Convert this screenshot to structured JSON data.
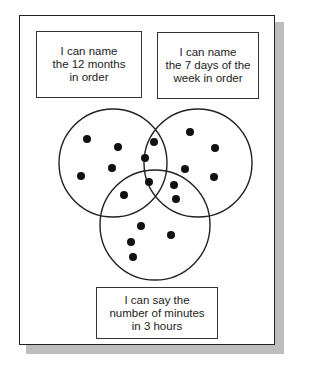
{
  "labels": {
    "months": "I can name\nthe 12 months\nin order",
    "days": "I can name\nthe 7 days of the\nweek in order",
    "minutes": "I can say the\nnumber of minutes\nin 3 hours"
  },
  "colors": {
    "stroke": "#222222",
    "dot": "#111111",
    "shadow": "#bdbdbd"
  },
  "venn": {
    "circles": [
      {
        "name": "months",
        "cx": 113,
        "cy": 163,
        "r": 54
      },
      {
        "name": "days",
        "cx": 198,
        "cy": 163,
        "r": 54
      },
      {
        "name": "minutes",
        "cx": 155,
        "cy": 225,
        "r": 55
      }
    ],
    "dots": [
      {
        "x": 87,
        "y": 139
      },
      {
        "x": 118,
        "y": 147
      },
      {
        "x": 112,
        "y": 168
      },
      {
        "x": 81,
        "y": 176
      },
      {
        "x": 154,
        "y": 142
      },
      {
        "x": 145,
        "y": 158
      },
      {
        "x": 149,
        "y": 182
      },
      {
        "x": 124,
        "y": 195
      },
      {
        "x": 190,
        "y": 132
      },
      {
        "x": 215,
        "y": 148
      },
      {
        "x": 185,
        "y": 169
      },
      {
        "x": 214,
        "y": 177
      },
      {
        "x": 174,
        "y": 185
      },
      {
        "x": 176,
        "y": 199
      },
      {
        "x": 141,
        "y": 226
      },
      {
        "x": 171,
        "y": 235
      },
      {
        "x": 131,
        "y": 242
      },
      {
        "x": 133,
        "y": 257
      }
    ],
    "dot_radius": 4
  }
}
